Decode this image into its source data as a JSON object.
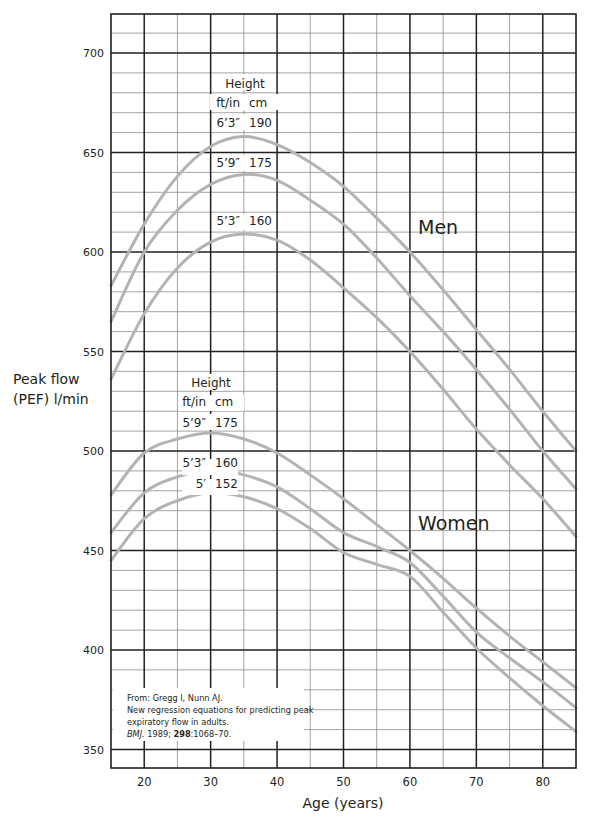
{
  "chart_data": {
    "type": "line",
    "title": "",
    "xlabel": "Age (years)",
    "ylabel": "Peak flow (PEF) l/min",
    "ylabel_lines": [
      "Peak flow",
      "(PEF) l/min"
    ],
    "xlim": [
      15,
      85
    ],
    "ylim": [
      340,
      720
    ],
    "xticks": [
      20,
      30,
      40,
      50,
      60,
      70,
      80
    ],
    "yticks": [
      350,
      400,
      450,
      500,
      550,
      600,
      650,
      700
    ],
    "grid": true,
    "grid_minor_x": 5,
    "grid_minor_y": 10,
    "x": [
      15,
      20,
      25,
      30,
      35,
      40,
      45,
      50,
      55,
      60,
      65,
      70,
      75,
      80,
      85
    ],
    "groups": [
      {
        "name": "Men",
        "height_header": "Height",
        "unit_headers": [
          "ft/in",
          "cm"
        ],
        "series": [
          {
            "name": "Men 6'3\" / 190 cm",
            "ft_in": "6’3″",
            "cm": "190",
            "values": [
              583,
              614,
              638,
              653,
              658,
              654,
              645,
              633,
              617,
              600,
              581,
              561,
              541,
              520,
              500
            ]
          },
          {
            "name": "Men 5'9\" / 175 cm",
            "ft_in": "5’9″",
            "cm": "175",
            "values": [
              565,
              600,
              621,
              634,
              639,
              636,
              626,
              614,
              597,
              578,
              560,
              541,
              521,
              500,
              481
            ]
          },
          {
            "name": "Men 5'3\" / 160 cm",
            "ft_in": "5’3″",
            "cm": "160",
            "values": [
              536,
              569,
              592,
              605,
              609,
              606,
              596,
              582,
              567,
              550,
              531,
              511,
              493,
              476,
              457
            ]
          }
        ]
      },
      {
        "name": "Women",
        "height_header": "Height",
        "unit_headers": [
          "ft/in",
          "cm"
        ],
        "series": [
          {
            "name": "Women 5'9\" / 175 cm",
            "ft_in": "5’9″",
            "cm": "175",
            "values": [
              478,
              499,
              506,
              509,
              506,
              499,
              488,
              476,
              463,
              450,
              436,
              421,
              407,
              394,
              381
            ]
          },
          {
            "name": "Women 5'3\" / 160 cm",
            "ft_in": "5’3″",
            "cm": "160",
            "values": [
              459,
              479,
              487,
              491,
              488,
              482,
              471,
              459,
              452,
              444,
              427,
              409,
              396,
              384,
              371
            ]
          },
          {
            "name": "Women 5' / 152 cm",
            "ft_in": "5′",
            "cm": "152",
            "values": [
              445,
              466,
              475,
              479,
              477,
              471,
              461,
              449,
              443,
              437,
              419,
              401,
              386,
              372,
              359
            ]
          }
        ]
      }
    ],
    "annotations": [
      "Men",
      "Women"
    ],
    "source": [
      "From:  Gregg I, Nunn AJ.",
      "New regression equations for predicting peak",
      "expiratory flow in adults."
    ],
    "citation": {
      "journal": "BMJ.",
      "year_text": " 1989; ",
      "volume": "298",
      "pages": ":1068–70."
    },
    "colors": {
      "curve": "#b3b3b3",
      "major_grid": "#231f20",
      "minor_grid": "#8c8c8c",
      "background": "#ffffff"
    }
  }
}
